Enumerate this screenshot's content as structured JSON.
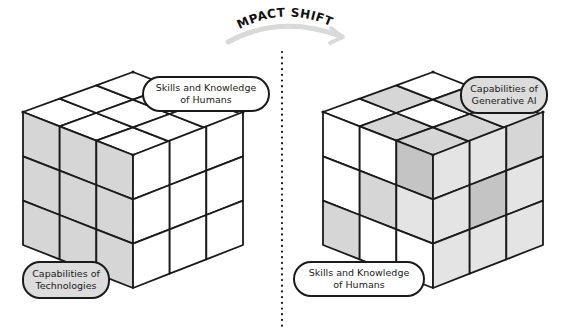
{
  "title": "IMPACT SHIFT",
  "colors": {
    "stroke": "#1a1a1a",
    "white": "#ffffff",
    "grey_light": "#e4e4e4",
    "grey_mid": "#d6d6d6",
    "grey_dark": "#c4c4c4",
    "arrow": "#d9d9d9"
  },
  "left_cube": {
    "top_label": "Skills and Knowledge of Humans",
    "bottom_label": "Capabilities of Technologies",
    "shading": "left face grey (technologies), top and right faces white (humans)"
  },
  "right_cube": {
    "top_label": "Capabilities of Generative AI",
    "bottom_label": "Skills and Knowledge of Humans",
    "shading": "mixed grey (generative AI) and white (humans) tiles across all faces"
  },
  "divider": "dotted vertical line"
}
